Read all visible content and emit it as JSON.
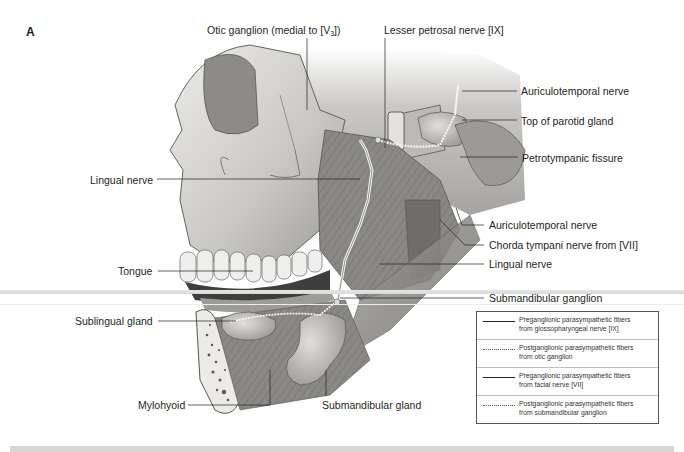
{
  "figure": {
    "panel_letter": "A",
    "labels": {
      "otic_ganglion": {
        "text": "Otic ganglion (medial to [V",
        "sub": "3",
        "tail": "])"
      },
      "lesser_petrosal_nerve": "Lesser petrosal nerve [IX]",
      "auriculotemporal_nerve_top": "Auriculotemporal nerve",
      "top_of_parotid_gland": "Top of parotid gland",
      "petrotympanic_fissure": "Petrotympanic fissure",
      "lingual_nerve_left": "Lingual nerve",
      "auriculotemporal_nerve_lower": "Auriculotemporal nerve",
      "chorda_tympani": "Chorda tympani nerve from [VII]",
      "lingual_nerve_right": "Lingual nerve",
      "tongue": "Tongue",
      "submandibular_ganglion": "Submandibular ganglion",
      "sublingual_gland": "Sublingual gland",
      "mylohyoid": "Mylohyoid",
      "submandibular_gland": "Submandibular gland"
    },
    "legend": [
      {
        "style": "solid",
        "line1": "Preganglionic parasympathetic fibers",
        "line2": "from glossopharyngeal nerve [IX]"
      },
      {
        "style": "dotted",
        "line1": "Postganglionic parasympathetic fibers",
        "line2": "from otic ganglion"
      },
      {
        "style": "solid",
        "line1": "Preganglionic parasympathetic fibers",
        "line2": "from facial nerve [VII]"
      },
      {
        "style": "dotted",
        "line1": "Postganglionic parasympathetic fibers",
        "line2": "from submandibular ganglion"
      }
    ],
    "colors": {
      "bone": "#d9d7d4",
      "muscle": "#8c8a88",
      "gland": "#c8c6c4",
      "text": "#231f20"
    }
  }
}
